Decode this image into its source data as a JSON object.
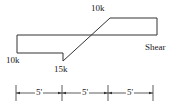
{
  "diagram": {
    "type": "shear-force-diagram",
    "title": "Shear",
    "line_color": "#333333",
    "values": {
      "left_value": "10k",
      "min_value": "15k",
      "max_value": "10k"
    },
    "segments": [
      {
        "label": "5'",
        "length_ft": 5
      },
      {
        "label": "5'",
        "length_ft": 5
      },
      {
        "label": "5'",
        "length_ft": 5
      }
    ],
    "shear_points": [
      {
        "x_ft": 0,
        "v_k": 0
      },
      {
        "x_ft": 0,
        "v_k": -10
      },
      {
        "x_ft": 5,
        "v_k": -10
      },
      {
        "x_ft": 5,
        "v_k": -15
      },
      {
        "x_ft": 10,
        "v_k": 10
      },
      {
        "x_ft": 15,
        "v_k": 10
      },
      {
        "x_ft": 15,
        "v_k": 0
      }
    ]
  }
}
